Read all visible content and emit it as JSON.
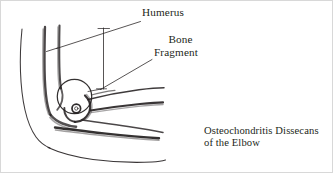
{
  "figure": {
    "title": "Osteochondritis Dissecans of the Elbow",
    "medium": "hand-drawn line illustration",
    "ink_color": "#231f20",
    "background_color": "#ffffff",
    "frame_color": "#d8d8d8",
    "width": 333,
    "height": 173
  },
  "labels": {
    "humerus": "Humerus",
    "bone_fragment_line1": "Bone",
    "bone_fragment_line2": "Fragment"
  },
  "caption": {
    "line1": "Osteochondritis Dissecans",
    "line2": "of the Elbow"
  },
  "anatomy": {
    "parts": [
      "skin-outline-upper-arm",
      "humerus-shaft-anterior-cortex",
      "humerus-shaft-posterior-cortex",
      "capitellum-circle",
      "bone-fragment-circle",
      "olecranon",
      "radius",
      "ulna",
      "skin-outline-forearm"
    ]
  },
  "leaders": {
    "humerus_leader": "line from Humerus label to humerus shaft",
    "humerus_vertical_leader": "vertical line from Humerus label down to joint",
    "bone_fragment_leader": "line from Bone Fragment label to joint fragment"
  }
}
